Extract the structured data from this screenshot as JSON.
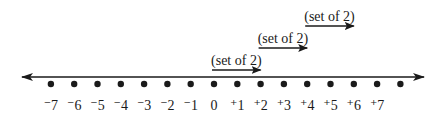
{
  "number_line": {
    "start": -7,
    "end": 8,
    "labels": [
      "⁻7",
      "⁻6",
      "⁻5",
      "⁻4",
      "⁻3",
      "⁻2",
      "⁻1",
      "0",
      "⁺1",
      "⁺2",
      "⁺3",
      "⁺4",
      "⁺5",
      "⁺6",
      "⁺7"
    ],
    "arrow_both_ends": true
  },
  "jumps": [
    {
      "from": 0,
      "to": 2,
      "label": "(set of 2)"
    },
    {
      "from": 2,
      "to": 4,
      "label": "(set of 2)"
    },
    {
      "from": 4,
      "to": 6,
      "label": "(set of 2)"
    }
  ],
  "colors": {
    "ink": "#1a1a1a"
  }
}
